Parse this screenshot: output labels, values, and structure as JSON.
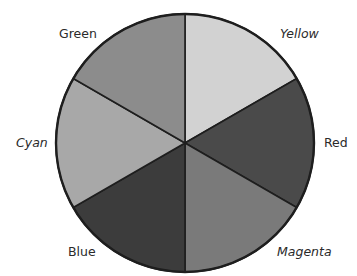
{
  "chart_data": {
    "type": "pie",
    "title": "",
    "categories": [
      "Yellow",
      "Red",
      "Magenta",
      "Blue",
      "Cyan",
      "Green"
    ],
    "values": [
      1,
      1,
      1,
      1,
      1,
      1
    ],
    "start_angle_deg": 0,
    "direction": "clockwise",
    "fills": [
      "#d2d2d2",
      "#4a4a4a",
      "#7a7a7a",
      "#3c3c3c",
      "#a8a8a8",
      "#8c8c8c"
    ],
    "label_italic": [
      true,
      false,
      true,
      false,
      true,
      false
    ],
    "legend": "none",
    "geometry": {
      "cx": 185,
      "cy": 143,
      "r": 129
    },
    "labels": [
      {
        "text": "Yellow",
        "x": 280,
        "y": 28,
        "italic": true
      },
      {
        "text": "Red",
        "x": 324,
        "y": 137,
        "italic": false
      },
      {
        "text": "Magenta",
        "x": 277,
        "y": 246,
        "italic": true
      },
      {
        "text": "Blue",
        "x": 68,
        "y": 246,
        "italic": false
      },
      {
        "text": "Cyan",
        "x": 16,
        "y": 137,
        "italic": true
      },
      {
        "text": "Green",
        "x": 59,
        "y": 28,
        "italic": false
      }
    ]
  }
}
